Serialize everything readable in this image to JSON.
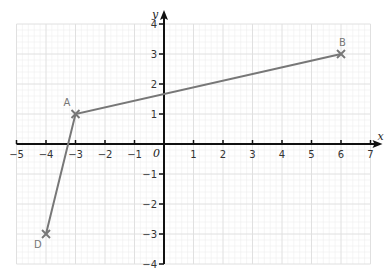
{
  "chart_data": {
    "type": "line",
    "title": "",
    "xlabel": "x",
    "ylabel": "y",
    "xlim": [
      -5,
      7
    ],
    "ylim": [
      -4,
      4
    ],
    "grid": true,
    "x_ticks": [
      -5,
      -4,
      -3,
      -2,
      -1,
      0,
      1,
      2,
      3,
      4,
      5,
      6,
      7
    ],
    "y_ticks": [
      -4,
      -3,
      -2,
      -1,
      1,
      2,
      3,
      4
    ],
    "origin_label": "0",
    "points": [
      {
        "label": "D",
        "x": -4,
        "y": -3
      },
      {
        "label": "A",
        "x": -3,
        "y": 1
      },
      {
        "label": "B",
        "x": 6,
        "y": 3
      }
    ],
    "series": [
      {
        "name": "D-A-B",
        "x": [
          -4,
          -3,
          6
        ],
        "y": [
          -3,
          1,
          3
        ],
        "color": "#777777"
      }
    ]
  },
  "colors": {
    "grid_minor": "#eeeeee",
    "grid_major": "#e0e0e0",
    "axis": "#111111",
    "line": "#777777",
    "marker": "#777777"
  }
}
